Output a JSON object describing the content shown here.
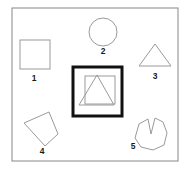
{
  "figure": {
    "canvas": {
      "width": 191,
      "height": 170,
      "background": "#ffffff"
    },
    "outer_frame": {
      "name": "outer-frame",
      "x": 12,
      "y": 8,
      "width": 166,
      "height": 153,
      "stroke": "#888888",
      "stroke_width": 1,
      "fill": "none"
    },
    "highlight_box": {
      "name": "highlight-box",
      "x": 73,
      "y": 67,
      "width": 49,
      "height": 49,
      "stroke": "#111111",
      "stroke_width": 3,
      "fill": "none"
    },
    "stroke_color": "#9a9a9a",
    "label_color": "#1a1a1a",
    "shapes": [
      {
        "id": 1,
        "name": "shape-square-1",
        "type": "square",
        "label": "1",
        "label_x": 34,
        "label_y": 81,
        "geometry": {
          "x": 20,
          "y": 40,
          "width": 30,
          "height": 29
        }
      },
      {
        "id": 2,
        "name": "shape-circle-2",
        "type": "circle",
        "label": "2",
        "label_x": 103,
        "label_y": 54,
        "geometry": {
          "cx": 103,
          "cy": 32,
          "r": 14
        }
      },
      {
        "id": 3,
        "name": "shape-triangle-3",
        "type": "triangle",
        "label": "3",
        "label_x": 155,
        "label_y": 79,
        "geometry": {
          "points": "155,44 139,66 171,66"
        }
      },
      {
        "id": 4,
        "name": "shape-quadrilateral-4",
        "type": "quadrilateral",
        "label": "4",
        "label_x": 42,
        "label_y": 154,
        "geometry": {
          "points": "24,123 49,112 58,134 45,146"
        }
      },
      {
        "id": 5,
        "name": "shape-notched-blob-5",
        "type": "notched-polygon",
        "label": "5",
        "label_x": 133,
        "label_y": 149,
        "geometry": {
          "points": "139,124 148,119 151,134 155,118 163,122 167,133 164,145 153,150 141,147 135,138"
        }
      }
    ],
    "boxed_shapes": [
      {
        "name": "boxed-square",
        "type": "square",
        "geometry": {
          "x": 85,
          "y": 76,
          "width": 30,
          "height": 28
        }
      },
      {
        "name": "boxed-triangle",
        "type": "triangle",
        "geometry": {
          "points": "97,75 79,105 114,105"
        }
      }
    ]
  }
}
